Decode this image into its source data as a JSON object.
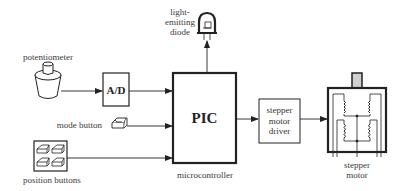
{
  "diagram": {
    "type": "block-diagram",
    "colors": {
      "stroke": "#222222",
      "text": "#3a3a3a",
      "shaft_fill": "#d0d0d0",
      "background": "#ffffff"
    },
    "components": {
      "potentiometer": {
        "label": "potentiometer",
        "icon": "potentiometer-icon"
      },
      "ad_converter": {
        "label": "A/D"
      },
      "mode_button": {
        "label": "mode button",
        "icon": "push-button-icon"
      },
      "position_buttons": {
        "label": "position buttons",
        "icon": "button-array-icon",
        "count": 4
      },
      "led": {
        "label_line1": "light-",
        "label_line2": "emitting",
        "label_line3": "diode",
        "icon": "led-icon"
      },
      "pic": {
        "label": "PIC",
        "caption": "microcontroller"
      },
      "driver": {
        "line1": "stepper",
        "line2": "motor",
        "line3": "driver"
      },
      "motor": {
        "line1": "stepper",
        "line2": "motor",
        "icon": "stepper-motor-icon"
      }
    },
    "connections": [
      {
        "from": "potentiometer",
        "to": "A/D"
      },
      {
        "from": "A/D",
        "to": "PIC"
      },
      {
        "from": "mode button",
        "to": "PIC"
      },
      {
        "from": "position buttons",
        "to": "PIC"
      },
      {
        "from": "PIC",
        "to": "light-emitting diode"
      },
      {
        "from": "PIC",
        "to": "stepper motor driver"
      },
      {
        "from": "stepper motor driver",
        "to": "stepper motor"
      }
    ]
  }
}
